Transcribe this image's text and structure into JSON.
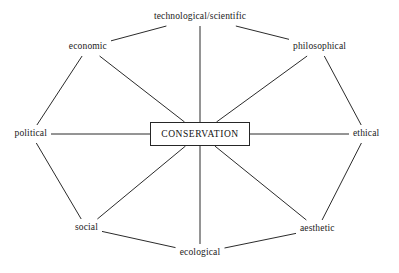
{
  "diagram": {
    "center": {
      "label": "CONSERVATION",
      "shape": "rectangle",
      "x": 200,
      "y": 134,
      "width": 100,
      "height": 24
    },
    "line_color": "#2b2b2b",
    "text_color": "#1a1a1a",
    "background_color": "#ffffff",
    "nodes": [
      {
        "id": "technological",
        "label": "technological/scientific",
        "x": 200,
        "y": 17,
        "anchor": "center"
      },
      {
        "id": "philosophical",
        "label": "philosophical",
        "x": 293,
        "y": 47,
        "anchor": "left"
      },
      {
        "id": "ethical",
        "label": "ethical",
        "x": 353,
        "y": 134,
        "anchor": "left"
      },
      {
        "id": "aesthetic",
        "label": "aesthetic",
        "x": 300,
        "y": 229,
        "anchor": "left"
      },
      {
        "id": "ecological",
        "label": "ecological",
        "x": 200,
        "y": 253,
        "anchor": "center"
      },
      {
        "id": "social",
        "label": "social",
        "x": 98,
        "y": 228,
        "anchor": "right"
      },
      {
        "id": "political",
        "label": "political",
        "x": 47,
        "y": 134,
        "anchor": "right"
      },
      {
        "id": "economic",
        "label": "economic",
        "x": 107,
        "y": 47,
        "anchor": "right"
      }
    ],
    "spokes": [
      {
        "from": "center",
        "to": "technological"
      },
      {
        "from": "center",
        "to": "philosophical"
      },
      {
        "from": "center",
        "to": "ethical"
      },
      {
        "from": "center",
        "to": "aesthetic"
      },
      {
        "from": "center",
        "to": "ecological"
      },
      {
        "from": "center",
        "to": "social"
      },
      {
        "from": "center",
        "to": "political"
      },
      {
        "from": "center",
        "to": "economic"
      }
    ],
    "perimeter": [
      {
        "from": "technological",
        "to": "philosophical"
      },
      {
        "from": "philosophical",
        "to": "ethical"
      },
      {
        "from": "ethical",
        "to": "aesthetic"
      },
      {
        "from": "aesthetic",
        "to": "ecological"
      },
      {
        "from": "ecological",
        "to": "social"
      },
      {
        "from": "social",
        "to": "political"
      },
      {
        "from": "political",
        "to": "economic"
      },
      {
        "from": "economic",
        "to": "technological"
      }
    ]
  }
}
